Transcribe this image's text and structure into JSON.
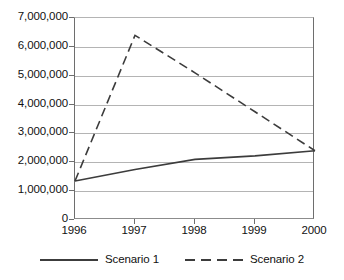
{
  "chart_data": {
    "type": "line",
    "title": "",
    "subtitle": "",
    "xlabel": "",
    "ylabel": "",
    "categories": [
      "1996",
      "1997",
      "1998",
      "1999",
      "2000"
    ],
    "series": [
      {
        "name": "Scenario 1",
        "style": "solid",
        "color": "#3c3c3c",
        "values": [
          1350000,
          1750000,
          2100000,
          2220000,
          2400000
        ]
      },
      {
        "name": "Scenario 2",
        "style": "dashed",
        "color": "#3c3c3c",
        "values": [
          1350000,
          6400000,
          5100000,
          3750000,
          2400000
        ]
      }
    ],
    "ylim": [
      0,
      7000000
    ],
    "y_ticks": [
      0,
      1000000,
      2000000,
      3000000,
      4000000,
      5000000,
      6000000,
      7000000
    ],
    "y_tick_labels": [
      "0",
      "1,000,000",
      "2,000,000",
      "3,000,000",
      "4,000,000",
      "5,000,000",
      "6,000,000",
      "7,000,000"
    ],
    "grid": true,
    "grid_axis": "y",
    "legend_position": "bottom",
    "colors": {
      "grid": "#b4b4b4",
      "axis": "#6e6e6e",
      "series_line": "#3c3c3c",
      "text": "#111111",
      "background": "#ffffff"
    }
  },
  "legend": {
    "entries": [
      {
        "label": "Scenario 1",
        "swatch": "solid-line-swatch"
      },
      {
        "label": "Scenario 2",
        "swatch": "dashed-line-swatch"
      }
    ]
  }
}
